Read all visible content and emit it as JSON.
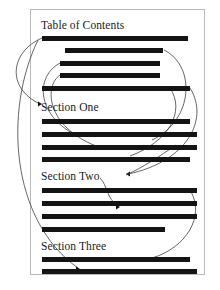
{
  "document": {
    "title": "Table of Contents",
    "page_border_color": "#b9b9b9",
    "bar_color": "#141414",
    "link_color": "#3f3f3f",
    "background": "#ffffff"
  },
  "headings": [
    {
      "id": "toc",
      "label": "Table of Contents",
      "x": 41,
      "y": 19
    },
    {
      "id": "section-one",
      "label": "Section One",
      "x": 41,
      "y": 101
    },
    {
      "id": "section-two",
      "label": "Section Two",
      "x": 41,
      "y": 170
    },
    {
      "id": "section-three",
      "label": "Section Three",
      "x": 41,
      "y": 240
    }
  ],
  "text_bars": [
    {
      "group": "toc",
      "x": 42,
      "y": 36,
      "w": 146
    },
    {
      "group": "toc",
      "x": 65,
      "y": 48,
      "w": 98
    },
    {
      "group": "toc",
      "x": 60,
      "y": 61,
      "w": 100
    },
    {
      "group": "toc",
      "x": 60,
      "y": 73,
      "w": 100
    },
    {
      "group": "toc",
      "x": 42,
      "y": 86,
      "w": 148
    },
    {
      "group": "body-1",
      "x": 42,
      "y": 119,
      "w": 148
    },
    {
      "group": "body-1",
      "x": 42,
      "y": 132,
      "w": 155
    },
    {
      "group": "body-1",
      "x": 42,
      "y": 145,
      "w": 155
    },
    {
      "group": "body-1",
      "x": 42,
      "y": 157,
      "w": 148
    },
    {
      "group": "body-2",
      "x": 42,
      "y": 188,
      "w": 155
    },
    {
      "group": "body-2",
      "x": 42,
      "y": 201,
      "w": 155
    },
    {
      "group": "body-2",
      "x": 42,
      "y": 214,
      "w": 155
    },
    {
      "group": "body-2",
      "x": 42,
      "y": 227,
      "w": 123
    },
    {
      "group": "body-3",
      "x": 42,
      "y": 257,
      "w": 148
    },
    {
      "group": "body-3",
      "x": 42,
      "y": 269,
      "w": 155
    }
  ],
  "links": [
    {
      "id": "link-toc1-to-section-one",
      "from": "toc-entry-1",
      "to": "section-one",
      "path": "M 42 38 C 10 52, 6 88, 40 104",
      "arrow": {
        "x": 42,
        "y": 104,
        "dir": "right"
      }
    },
    {
      "id": "link-toc2-to-body",
      "from": "toc-entry-2",
      "to": "section-one-body",
      "path": "M 164 50 C 196 66, 194 120, 152 140",
      "arrow": null
    },
    {
      "id": "link-toc3-to-body1",
      "from": "toc-entry-3",
      "to": "body-line-2",
      "path": "M 60 63 C 36 76, 36 112, 72 133",
      "arrow": {
        "x": 74,
        "y": 134,
        "dir": "right"
      }
    },
    {
      "id": "link-toc4-to-body2",
      "from": "toc-entry-4",
      "to": "body-line-3",
      "path": "M 60 75 C 44 86, 46 126, 96 146",
      "arrow": null
    },
    {
      "id": "link-toc5-to-section-two",
      "from": "toc-entry-5",
      "to": "section-two",
      "path": "M 190 88 C 210 120, 186 162, 128 174",
      "arrow": {
        "x": 126,
        "y": 174,
        "dir": "left"
      }
    },
    {
      "id": "link-body-to-section-two",
      "from": "body-line-4",
      "to": "section-two",
      "path": "M 176 145 C 160 156, 142 168, 126 175",
      "arrow": null
    },
    {
      "id": "link-section-two-to-body",
      "from": "section-two",
      "to": "body-line-7",
      "path": "M 100 178 C 108 186, 106 198, 118 206",
      "arrow": {
        "x": 120,
        "y": 207,
        "dir": "right"
      }
    },
    {
      "id": "link-long-left-to-section-three",
      "from": "toc-entry-1",
      "to": "section-three",
      "path": "M 38 40 C 4 110, 10 220, 78 268",
      "arrow": {
        "x": 80,
        "y": 269,
        "dir": "right"
      }
    },
    {
      "id": "link-right-to-body-3",
      "from": "section-two-body",
      "to": "body-line-14",
      "path": "M 190 190 C 206 216, 186 248, 152 258",
      "arrow": null
    },
    {
      "id": "link-mid-curve",
      "from": "toc-entry-5",
      "to": "body-line-6",
      "path": "M 170 88 C 186 112, 168 142, 130 156",
      "arrow": null
    }
  ]
}
